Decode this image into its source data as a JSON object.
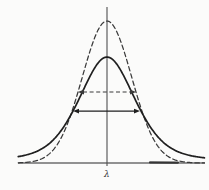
{
  "figure": {
    "background": "#fbfbfa",
    "ink_color": "#1f1f1f",
    "dashed_ink_color": "#3a3a3a",
    "axis_color": "#4f4f4f",
    "baseline_color": "#6e6e6e",
    "xlabel": "λ"
  },
  "chart_data": {
    "type": "line",
    "title": "",
    "subtitle": "",
    "xlabel": "λ",
    "ylabel": "",
    "grid": false,
    "legend": null,
    "x_unit": "dashed-profile FWHM = 1",
    "x_range": [
      -1.53,
      1.69
    ],
    "y_range": [
      0,
      1.1
    ],
    "axes": {
      "x_axis_line": true,
      "center_vertical_line": true,
      "x_tick_labels": [],
      "y_tick_labels": []
    },
    "series": [
      {
        "name": "narrow tall line profile",
        "line_style": "dashed",
        "shape": "gaussian",
        "center": 0,
        "peak": 1.0,
        "fwhm": 1.0
      },
      {
        "name": "broad low line profile",
        "line_style": "solid",
        "shape": "pseudo-voigt",
        "lorentz_fraction": 0.45,
        "center": 0,
        "peak": 0.746,
        "fwhm": 1.155
      }
    ],
    "annotations": [
      {
        "type": "fwhm-double-arrow",
        "label": "FWHM of dashed profile",
        "line_style": "dashed",
        "y": 0.5,
        "x1": -0.5,
        "x2": 0.5
      },
      {
        "type": "fwhm-double-arrow",
        "label": "FWHM of solid profile",
        "line_style": "solid",
        "y": 0.366,
        "x1": -0.586,
        "x2": 0.569
      }
    ]
  }
}
